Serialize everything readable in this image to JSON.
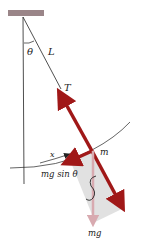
{
  "diagram": {
    "labels": {
      "theta": "θ",
      "length": "L",
      "tension": "T",
      "mass": "m",
      "displacement": "x",
      "restoring": "mg sin θ",
      "weight": "mg"
    },
    "colors": {
      "support": "#9a8588",
      "arrow": "#a01818",
      "weight_arrow": "#d8aab0",
      "shade": "#dcdcdc",
      "line": "#222222"
    }
  }
}
